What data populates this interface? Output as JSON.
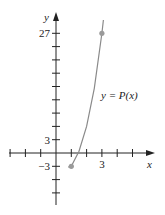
{
  "chart_data": {
    "type": "line",
    "title": "",
    "xlabel": "x",
    "ylabel": "y",
    "curve_label": "y = P(x)",
    "xlim": [
      -3,
      6
    ],
    "ylim": [
      -9,
      31
    ],
    "x_ticks": [
      -3,
      -2,
      -1,
      1,
      2,
      3,
      4,
      5
    ],
    "x_tick_labels": [
      {
        "value": 3,
        "label": "3"
      }
    ],
    "y_ticks": [
      -9,
      -6,
      -3,
      3,
      6,
      9,
      12,
      15,
      18,
      21,
      24,
      27
    ],
    "y_tick_labels": [
      {
        "value": 27,
        "label": "27"
      },
      {
        "value": 3,
        "label": "3"
      },
      {
        "value": -3,
        "label": "−3"
      }
    ],
    "points": [
      {
        "x": 1,
        "y": -3
      },
      {
        "x": 3,
        "y": 27
      }
    ],
    "series": [
      {
        "name": "y = P(x)",
        "x": [
          0.8,
          1,
          1.5,
          2,
          2.5,
          3,
          3.1
        ],
        "y": [
          -3.2,
          -3,
          0.4,
          6,
          14.6,
          27,
          30
        ]
      }
    ],
    "colors": {
      "axis": "#222222",
      "curve": "#8a8a8a",
      "point": "#9a9a9a"
    },
    "grid": false
  }
}
